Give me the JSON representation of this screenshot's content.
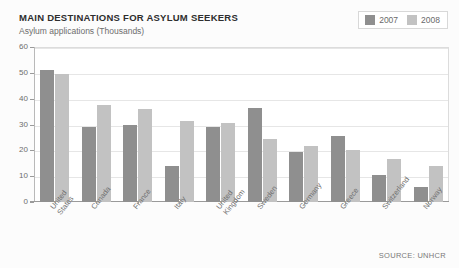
{
  "header": {
    "title": "MAIN DESTINATIONS FOR ASYLUM SEEKERS",
    "subtitle": "Asylum applications (Thousands)"
  },
  "source_note": "SOURCE: UNHCR",
  "colors": {
    "series_2007": "#8f8f8f",
    "series_2008": "#c2c2c2",
    "grid": "#e6e6e6",
    "axis": "#9a9a9a",
    "text": "#6d6d6d",
    "title": "#2e2e2e",
    "background": "#ffffff"
  },
  "legend": {
    "position": "top-right",
    "items": [
      {
        "label": "2007",
        "color": "#8f8f8f"
      },
      {
        "label": "2008",
        "color": "#c2c2c2"
      }
    ]
  },
  "chart_data": {
    "type": "bar",
    "title": "MAIN DESTINATIONS FOR ASYLUM SEEKERS",
    "subtitle": "Asylum applications (Thousands)",
    "xlabel": "",
    "ylabel": "Asylum applications (Thousands)",
    "ylim": [
      0,
      60
    ],
    "yticks": [
      0,
      10,
      20,
      30,
      40,
      50,
      60
    ],
    "ytick_labels": [
      "0",
      "10",
      "20",
      "30",
      "40",
      "50",
      "60"
    ],
    "grid": true,
    "legend_position": "top-right",
    "categories": [
      "United States",
      "Canada",
      "France",
      "Italy",
      "United Kingdom",
      "Sweden",
      "Germany",
      "Greece",
      "Switzerland",
      "Norway"
    ],
    "category_lines": [
      [
        "United",
        "States"
      ],
      [
        "Canada"
      ],
      [
        "France"
      ],
      [
        "Italy"
      ],
      [
        "United",
        "Kingdom"
      ],
      [
        "Sweden"
      ],
      [
        "Germany"
      ],
      [
        "Greece"
      ],
      [
        "Switzerland"
      ],
      [
        "Norway"
      ]
    ],
    "series": [
      {
        "name": "2007",
        "color": "#8f8f8f",
        "values": [
          51,
          29,
          30,
          14,
          29,
          36.5,
          19.5,
          25.5,
          10.5,
          6
        ]
      },
      {
        "name": "2008",
        "color": "#c2c2c2",
        "values": [
          49.5,
          37.5,
          36,
          31.5,
          30.5,
          24.5,
          21.5,
          20,
          16.5,
          14
        ]
      }
    ],
    "source": "SOURCE: UNHCR"
  }
}
